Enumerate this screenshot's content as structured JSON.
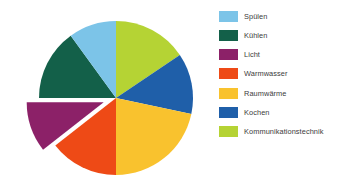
{
  "chart_data": {
    "type": "pie",
    "title": "",
    "subtitle": "",
    "xlabel": "",
    "ylabel": "",
    "grid": false,
    "legend_position": "right",
    "start_angle_deg": 0,
    "direction": "clockwise",
    "exploded_slices": [
      "Licht"
    ],
    "categories": [
      "Kommunikationstechnik",
      "Kochen",
      "Raumwärme",
      "Warmwasser",
      "Licht",
      "Kühlen",
      "Spülen"
    ],
    "values": [
      15.5,
      13.0,
      21.5,
      14.5,
      10.5,
      15.0,
      10.0
    ],
    "slices": [
      {
        "label": "Kommunikationstechnik",
        "value": 15.5,
        "color": "#b5d334",
        "start_deg": 0,
        "end_deg": 56,
        "exploded": false
      },
      {
        "label": "Kochen",
        "value": 13.0,
        "color": "#1f5fa9",
        "start_deg": 56,
        "end_deg": 102,
        "exploded": false
      },
      {
        "label": "Raumwärme",
        "value": 21.5,
        "color": "#f9c22e",
        "start_deg": 102,
        "end_deg": 180,
        "exploded": false
      },
      {
        "label": "Warmwasser",
        "value": 14.5,
        "color": "#ee4a16",
        "start_deg": 180,
        "end_deg": 232,
        "exploded": false
      },
      {
        "label": "Licht",
        "value": 10.5,
        "color": "#8c2168",
        "start_deg": 232,
        "end_deg": 270,
        "exploded": true
      },
      {
        "label": "Kühlen",
        "value": 15.0,
        "color": "#136049",
        "start_deg": 270,
        "end_deg": 324,
        "exploded": false
      },
      {
        "label": "Spülen",
        "value": 10.0,
        "color": "#7cc4e8",
        "start_deg": 324,
        "end_deg": 360,
        "exploded": false
      }
    ]
  },
  "legend": {
    "items": [
      {
        "label": "Spülen",
        "color": "#7cc4e8"
      },
      {
        "label": "Kühlen",
        "color": "#136049"
      },
      {
        "label": "Licht",
        "color": "#8c2168"
      },
      {
        "label": "Warmwasser",
        "color": "#ee4a16"
      },
      {
        "label": "Raumwärme",
        "color": "#f9c22e"
      },
      {
        "label": "Kochen",
        "color": "#1f5fa9"
      },
      {
        "label": "Kommunikationstechnik",
        "color": "#b5d334"
      }
    ]
  },
  "geometry": {
    "center_x": 116,
    "center_y": 98,
    "radius": 77,
    "explode_offset": 13
  },
  "colors": {
    "background": "#ffffff",
    "legend_text": "#3b3b3b"
  }
}
